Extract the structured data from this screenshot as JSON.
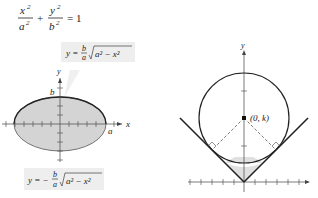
{
  "equation": {
    "lhs_a_num": "x",
    "lhs_a_den": "a",
    "lhs_b_num": "y",
    "lhs_b_den": "b",
    "exp": "2",
    "plus": "+",
    "rhs": "= 1"
  },
  "left_figure": {
    "upper_label": {
      "y": "y =",
      "frac_num": "b",
      "frac_den": "a",
      "radicand": "a² − x²"
    },
    "lower_label": {
      "y": "y = −",
      "frac_num": "b",
      "frac_den": "a",
      "radicand": "a² − x²"
    },
    "axis_x": "x",
    "axis_y": "y",
    "point_b": "b",
    "point_a": "a",
    "fill_color": "#d4d4d4",
    "stroke_color": "#222222"
  },
  "right_figure": {
    "center_label": "(0, k)",
    "axis_y": "y",
    "fill_color": "#e0e0e0"
  }
}
